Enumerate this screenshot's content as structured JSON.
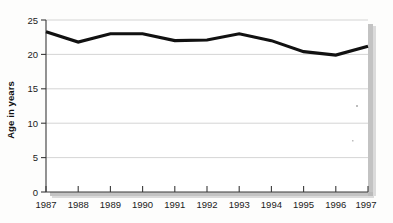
{
  "chart_data": {
    "type": "line",
    "title": "",
    "subtitle": "",
    "xlabel": "",
    "ylabel": "Age in years",
    "x": [
      1987,
      1988,
      1989,
      1990,
      1991,
      1992,
      1993,
      1994,
      1995,
      1996,
      1997
    ],
    "categories": [
      "1987",
      "1988",
      "1989",
      "1990",
      "1991",
      "1992",
      "1993",
      "1994",
      "1995",
      "1996",
      "1997"
    ],
    "values": [
      23.3,
      21.8,
      23.0,
      23.0,
      22.0,
      22.1,
      23.0,
      22.0,
      20.4,
      19.9,
      21.2
    ],
    "series": [
      {
        "name": "Age in years",
        "values": [
          23.3,
          21.8,
          23.0,
          23.0,
          22.0,
          22.1,
          23.0,
          22.0,
          20.4,
          19.9,
          21.2
        ],
        "color": "#111111"
      }
    ],
    "ylim": [
      0,
      25
    ],
    "yticks": [
      0,
      5,
      10,
      15,
      20,
      25
    ],
    "ytick_labels": [
      "0",
      "5",
      "10",
      "15",
      "20",
      "25"
    ],
    "xtick_labels": [
      "1987",
      "1988",
      "1989",
      "1990",
      "1991",
      "1992",
      "1993",
      "1994",
      "1995",
      "1996",
      "1997"
    ],
    "grid": true,
    "grid_axis": "y",
    "legend": false,
    "legend_position": "none",
    "line_color": "#111111",
    "grid_color": "#c9c9c9",
    "axis_color": "#3a3a3a",
    "background_color": "#fdfdfc",
    "annotations": []
  },
  "axis": {
    "y_title": "Age in years"
  }
}
